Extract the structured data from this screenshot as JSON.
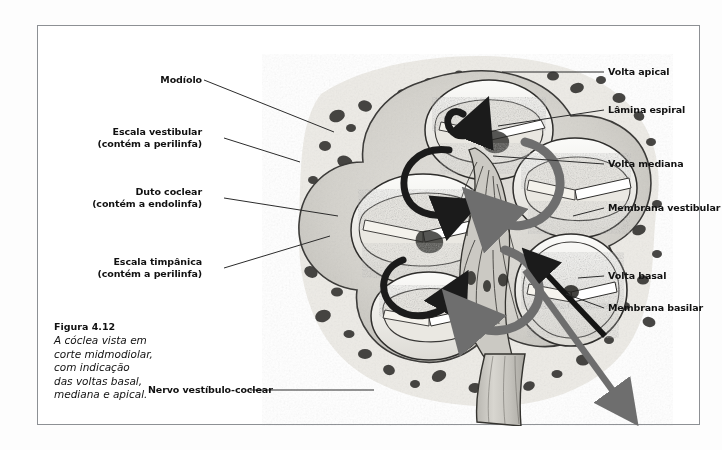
{
  "figure": {
    "caption_title": "Figura 4.12",
    "caption_body": "A cóclea vista em\ncorte midmodiolar,\ncom indicação\ndas voltas basal,\nmediana e apical."
  },
  "labels": {
    "right": [
      {
        "id": "volta-apical",
        "text": "Volta apical"
      },
      {
        "id": "lamina-espiral",
        "text": "Lâmina espiral"
      },
      {
        "id": "volta-mediana",
        "text": "Volta mediana"
      },
      {
        "id": "membrana-vestibular",
        "text": "Membrana vestibular"
      },
      {
        "id": "volta-basal",
        "text": "Volta basal"
      },
      {
        "id": "membrana-basilar",
        "text": "Membrana basilar"
      }
    ],
    "left": [
      {
        "id": "modiolo",
        "text": "Modíolo"
      },
      {
        "id": "escala-vestibular",
        "text": "Escala vestibular\n(contém a perilinfa)"
      },
      {
        "id": "duto-coclear",
        "text": "Duto coclear\n(contém a endolinfa)"
      },
      {
        "id": "escala-timpanica",
        "text": "Escala timpânica\n(contém a perilinfa)"
      }
    ],
    "bottom": [
      {
        "id": "nervo-vestibulo-coclear",
        "text": "Nervo vestíbulo-coclear"
      }
    ]
  },
  "colors": {
    "frame_border": "#8d9094",
    "label_text": "#111111",
    "leader_line": "#2b2b2b",
    "arrow_black": "#1b1b1b",
    "arrow_gray": "#6e6e6e",
    "bone_fill": "#cfcdc8",
    "tissue_light": "#efeee9"
  }
}
